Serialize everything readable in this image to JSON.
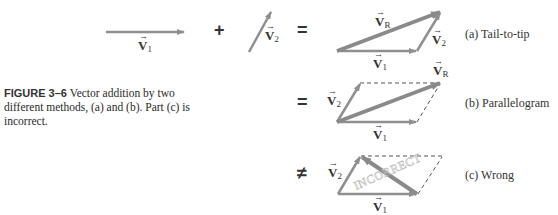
{
  "caption": {
    "figure_label": "FIGURE 3–6",
    "text": " Vector addition by two different methods, (a) and (b). Part (c) is incorrect."
  },
  "operators": {
    "plus": "+",
    "equals_a": "=",
    "equals_b": "=",
    "not_equal_c": "≠"
  },
  "panels": {
    "a": {
      "label": "(a) Tail-to-tip"
    },
    "b": {
      "label": "(b) Parallelogram"
    },
    "c": {
      "label": "(c) Wrong",
      "watermark": "INCORRECT"
    }
  },
  "vectors": {
    "v1": "V",
    "v1_sub": "1",
    "v2": "V",
    "v2_sub": "2",
    "vR": "V",
    "vR_sub": "R"
  },
  "colors": {
    "arrow": "#8f8f8f",
    "text": "#333333",
    "dashed": "#555555"
  }
}
